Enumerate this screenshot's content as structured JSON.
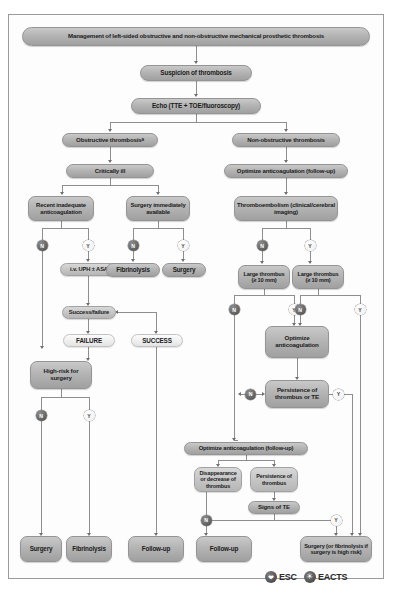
{
  "diagram": {
    "title": "Management of left-sided obstructive and non-obstructive mechanical prosthetic thrombosis",
    "colors": {
      "node_grey": "#b4b4b4",
      "node_mid": "#c6c6c6",
      "node_pale": "#f0f0f0",
      "connector": "#8e8e8e",
      "badge_no": "#5d5d5d",
      "badge_yes": "#f2f2f2"
    },
    "nodes": {
      "title": "Management of left-sided obstructive and non-obstructive mechanical prosthetic thrombosis",
      "suspicion": "Suspicion of thrombosis",
      "echo": "Echo (TTE + TOE/fluoroscopy)",
      "obstructive": "Obstructive thrombosis",
      "obstructive_sup": "a",
      "non_obstructive": "Non-obstructive thrombosis",
      "critically_ill": "Critically ill",
      "optimize_ac_followup_top": "Optimize anticoagulation (follow-up)",
      "recent_inadequate": "Recent inadequate anticoagulation",
      "surgery_immediately": "Surgery immediately available",
      "thromboembolism": "Thromboembolism (clinical/cerebral imaging)",
      "iv_uph": "i.v. UPH ± ASA",
      "fibrinolysis_mid": "Fibrinolysis",
      "surgery_mid": "Surgery",
      "large_thrombus_left": "Large thrombus (≥ 10 mm)",
      "large_thrombus_right": "Large thrombus (≥ 10 mm)",
      "success_failure": "Success/failure",
      "failure": "FAILURE",
      "success": "SUCCESS",
      "high_risk": "High-risk for surgery",
      "optimize_ac": "Optimize anticoagulation",
      "persistence_te": "Persistence of thrombus or TE",
      "optimize_ac_followup_bottom": "Optimize anticoagulation (follow-up)",
      "disappearance": "Disappearance or decrease of thrombus",
      "persistence_thrombus": "Persistence of thrombus",
      "signs_te": "Signs of TE",
      "out_surgery": "Surgery",
      "out_fibrinolysis": "Fibrinolysis",
      "out_followup_1": "Follow-up",
      "out_followup_2": "Follow-up",
      "out_surgery_hr": "Surgery (or fibrinolysis if surgery is high risk)"
    },
    "branch_labels": {
      "no": "N",
      "yes": "Y"
    },
    "footer": {
      "esc_label": "ESC",
      "esc_icon": "heart-icon",
      "eacts_label": "EACTS",
      "eacts_icon": "globe-icon"
    }
  }
}
